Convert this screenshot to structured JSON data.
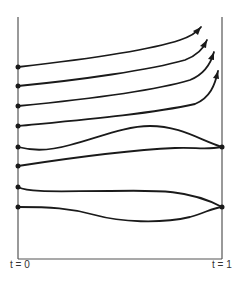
{
  "diagram": {
    "labels": {
      "start": "t = 0",
      "end": "t = 1"
    },
    "colors": {
      "line": "#1a1a1a",
      "axis": "#555555",
      "background": "#ffffff"
    },
    "start_points_y": [
      67,
      86,
      106,
      126,
      147,
      166,
      187,
      207
    ],
    "end_points": [
      {
        "x": 222,
        "y": 147,
        "joins_curves": [
          5,
          6
        ]
      },
      {
        "x": 222,
        "y": 207,
        "joins_curves": [
          7,
          8
        ]
      }
    ],
    "arrow_tips": [
      {
        "x": 201,
        "y": 27
      },
      {
        "x": 207,
        "y": 40
      },
      {
        "x": 214,
        "y": 52
      },
      {
        "x": 218,
        "y": 71
      }
    ]
  }
}
